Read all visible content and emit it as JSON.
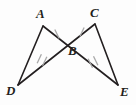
{
  "figure": {
    "kind": "geometry-diagram",
    "width": 136,
    "height": 105,
    "background_color": "#fdfdfd",
    "line_color": "#231f20",
    "tick_color": "#a8a8a8"
  },
  "points": {
    "A": {
      "label": "A",
      "x": 43,
      "y": 26,
      "label_x": 36,
      "label_y": 7
    },
    "B": {
      "label": "B",
      "x": 68,
      "y": 40,
      "label_x": 68,
      "label_y": 44
    },
    "C": {
      "label": "C",
      "x": 95,
      "y": 24,
      "label_x": 90,
      "label_y": 6
    },
    "D": {
      "label": "D",
      "x": 18,
      "y": 85,
      "label_x": 6,
      "label_y": 84
    },
    "E": {
      "label": "E",
      "x": 118,
      "y": 85,
      "label_x": 120,
      "label_y": 85
    }
  },
  "segments": [
    {
      "name": "AD",
      "from": "A",
      "to": "D",
      "x1": 43,
      "y1": 26,
      "x2": 18,
      "y2": 85
    },
    {
      "name": "AE",
      "from": "A",
      "to": "E",
      "x1": 43,
      "y1": 26,
      "x2": 118,
      "y2": 85
    },
    {
      "name": "CD",
      "from": "C",
      "to": "D",
      "x1": 95,
      "y1": 24,
      "x2": 18,
      "y2": 85
    },
    {
      "name": "CE",
      "from": "C",
      "to": "E",
      "x1": 95,
      "y1": 24,
      "x2": 118,
      "y2": 85
    }
  ],
  "tick_marks": [
    {
      "name": "tick-AB-single",
      "on_segment": "AB",
      "count": 1,
      "cx": 57,
      "cy": 34,
      "angle": -26
    },
    {
      "name": "tick-CB-single",
      "on_segment": "CB",
      "count": 1,
      "cx": 82,
      "cy": 32,
      "angle": 25
    },
    {
      "name": "tick-DB-double",
      "on_segment": "DB",
      "count": 2,
      "cx": 42,
      "cy": 60,
      "angle": 25
    },
    {
      "name": "tick-BE-double",
      "on_segment": "BE",
      "count": 2,
      "cx": 93,
      "cy": 62,
      "angle": -26
    }
  ],
  "labels": {
    "A": "A",
    "B": "B",
    "C": "C",
    "D": "D",
    "E": "E"
  }
}
